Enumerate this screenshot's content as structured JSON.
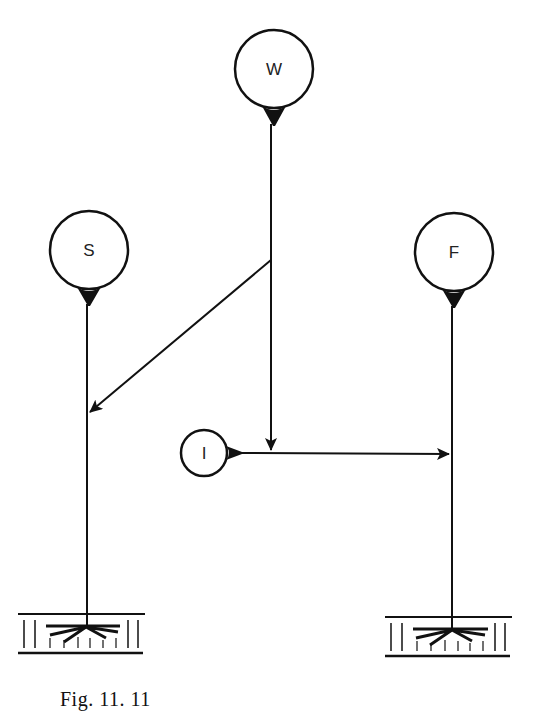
{
  "diagram": {
    "nodes": [
      {
        "id": "W",
        "label": "W"
      },
      {
        "id": "S",
        "label": "S"
      },
      {
        "id": "F",
        "label": "F"
      },
      {
        "id": "I",
        "label": "I"
      }
    ],
    "edges": [
      {
        "from": "W",
        "to": "S",
        "type": "arrow"
      },
      {
        "from": "W",
        "to": "I-F line",
        "type": "arrow"
      },
      {
        "from": "I",
        "to": "F",
        "type": "arrow"
      }
    ],
    "effectors": [
      {
        "id": "muscle-S",
        "attached_to": "S"
      },
      {
        "id": "muscle-F",
        "attached_to": "F"
      }
    ]
  },
  "caption": "Fig. 11. 11"
}
